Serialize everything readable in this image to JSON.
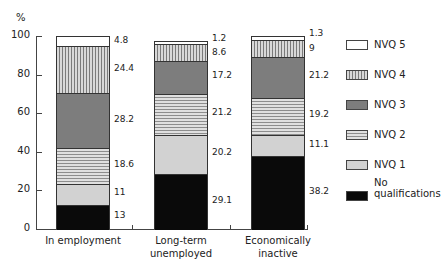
{
  "chart_data": {
    "type": "bar",
    "stacked": true,
    "title": "",
    "xlabel": "",
    "ylabel": "%",
    "ylim": [
      0,
      100
    ],
    "yticks": [
      0,
      20,
      40,
      60,
      80,
      100
    ],
    "grid": false,
    "legend_position": "right",
    "categories": [
      "In employment",
      "Long-term unemployed",
      "Economically inactive"
    ],
    "series": [
      {
        "name": "No qualifications",
        "values": [
          13,
          29.1,
          38.2
        ]
      },
      {
        "name": "NVQ 1",
        "values": [
          11,
          20.2,
          11.1
        ]
      },
      {
        "name": "NVQ 2",
        "values": [
          18.6,
          21.2,
          19.2
        ]
      },
      {
        "name": "NVQ 3",
        "values": [
          28.2,
          17.2,
          21.2
        ]
      },
      {
        "name": "NVQ 4",
        "values": [
          24.4,
          8.6,
          9
        ]
      },
      {
        "name": "NVQ 5",
        "values": [
          4.8,
          1.2,
          1.3
        ]
      }
    ],
    "value_labels": [
      [
        "13",
        "11",
        "18.6",
        "28.2",
        "24.4",
        "4.8"
      ],
      [
        "29.1",
        "20.2",
        "21.2",
        "17.2",
        "8.6",
        "1.2"
      ],
      [
        "38.2",
        "11.1",
        "19.2",
        "21.2",
        "9",
        "1.3"
      ]
    ]
  },
  "axis": {
    "y_unit": "%",
    "y_ticks": [
      "0",
      "20",
      "40",
      "60",
      "80",
      "100"
    ],
    "x_labels": [
      {
        "line1": "In employment",
        "line2": ""
      },
      {
        "line1": "Long-term",
        "line2": "unemployed"
      },
      {
        "line1": "Economically",
        "line2": "inactive"
      }
    ]
  },
  "legend": [
    {
      "label": "NVQ 5",
      "line2": ""
    },
    {
      "label": "NVQ 4",
      "line2": ""
    },
    {
      "label": "NVQ 3",
      "line2": ""
    },
    {
      "label": "NVQ 2",
      "line2": ""
    },
    {
      "label": "NVQ 1",
      "line2": ""
    },
    {
      "label": "No",
      "line2": "qualifications"
    }
  ]
}
